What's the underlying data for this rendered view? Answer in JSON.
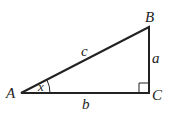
{
  "diagram": {
    "type": "right-triangle",
    "vertices": {
      "A": {
        "label": "A",
        "x": 21,
        "y": 93
      },
      "B": {
        "label": "B",
        "x": 149,
        "y": 27
      },
      "C": {
        "label": "C",
        "x": 149,
        "y": 93
      }
    },
    "sides": {
      "hypotenuse": {
        "label": "c"
      },
      "opposite": {
        "label": "a"
      },
      "adjacent": {
        "label": "b"
      }
    },
    "angle": {
      "label": "x",
      "vertex": "A"
    },
    "right_angle_at": "C",
    "colors": {
      "stroke": "#222222",
      "background": "#ffffff"
    }
  }
}
